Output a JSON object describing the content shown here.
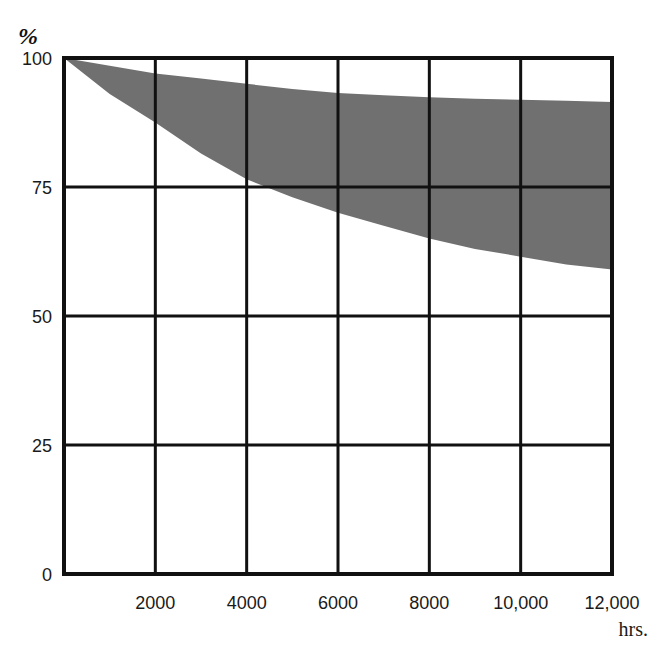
{
  "chart_data": {
    "type": "area",
    "title": "",
    "xlabel": "hrs.",
    "ylabel": "%",
    "xlim": [
      0,
      12000
    ],
    "ylim": [
      0,
      100
    ],
    "grid": true,
    "x_ticks": [
      "2000",
      "4000",
      "6000",
      "8000",
      "10,000",
      "12,000"
    ],
    "y_ticks": [
      "0",
      "25",
      "50",
      "75",
      "100"
    ],
    "x": [
      0,
      1000,
      2000,
      3000,
      4000,
      5000,
      6000,
      7000,
      8000,
      9000,
      10000,
      11000,
      12000
    ],
    "series": [
      {
        "name": "upper bound",
        "values": [
          100,
          98.5,
          97,
          96,
          95,
          94,
          93.2,
          92.8,
          92.4,
          92.1,
          91.9,
          91.7,
          91.5
        ]
      },
      {
        "name": "lower bound",
        "values": [
          100,
          93,
          87.5,
          81.5,
          76.5,
          73,
          70,
          67.5,
          65,
          63,
          61.5,
          60,
          59
        ]
      }
    ],
    "fill_color": "#707070"
  },
  "labels": {
    "y_unit": "%",
    "x_unit": "hrs."
  }
}
